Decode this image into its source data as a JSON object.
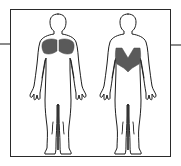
{
  "diagram": {
    "type": "muscle-anatomy",
    "views": [
      {
        "id": "front",
        "label": "Front view",
        "highlighted_muscles": [
          "chest"
        ]
      },
      {
        "id": "back",
        "label": "Back view",
        "highlighted_muscles": [
          "latissimus-dorsi"
        ]
      }
    ],
    "colors": {
      "highlight": "#5a5a5a",
      "outline": "#1e1e1e",
      "frame": "#2a2a2a",
      "connector": "#8a8a8a",
      "background": "#ffffff"
    }
  }
}
